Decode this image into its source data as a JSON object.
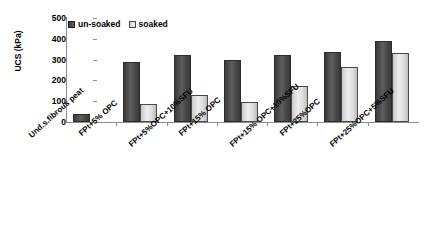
{
  "chart_data": {
    "type": "bar",
    "title": "",
    "xlabel": "",
    "ylabel": "UCS (kPa)",
    "ylim": [
      0,
      500
    ],
    "ytick_labels": [
      "500",
      "400",
      "300",
      "200",
      "100",
      "0"
    ],
    "ytick_values": [
      500,
      400,
      300,
      200,
      100,
      0
    ],
    "grid": false,
    "legend_position": "top-left",
    "categories": [
      "Und.s.fibrous peat",
      "FPt+5% OPC",
      "FPt+5%OPC+10%SFU",
      "FPt+15% OPC",
      "FPt+15% OPC+10%SFU",
      "FPt+25%OPC",
      "FPt+25%OPC+5%SFU"
    ],
    "series": [
      {
        "name": "un-soaked",
        "color": "#4a4a4a",
        "values": [
          38,
          288,
          320,
          300,
          320,
          335,
          390
        ]
      },
      {
        "name": "soaked",
        "color": "#e0e0e0",
        "values": [
          null,
          85,
          130,
          95,
          175,
          265,
          330
        ]
      }
    ]
  },
  "legend": {
    "items": [
      {
        "label": "un-soaked"
      },
      {
        "label": "soaked"
      }
    ]
  },
  "axis": {
    "y_title": "UCS (kPa)"
  }
}
